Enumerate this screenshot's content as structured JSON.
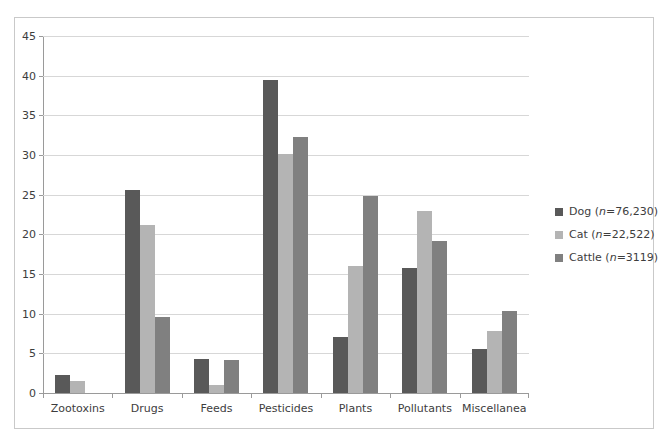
{
  "chart_data": {
    "type": "bar",
    "title": "",
    "subtitle": "",
    "xlabel": "",
    "ylabel": "",
    "ylim": [
      0,
      45
    ],
    "ytick_step": 5,
    "yticks": [
      45,
      40,
      35,
      30,
      25,
      20,
      15,
      10,
      5,
      0
    ],
    "grid": true,
    "legend_position": "right",
    "categories": [
      "Zootoxins",
      "Drugs",
      "Feeds",
      "Pesticides",
      "Plants",
      "Pollutants",
      "Miscellanea"
    ],
    "series": [
      {
        "name": "Dog (n=76,230)",
        "label_base": "Dog",
        "label_n": "n=76,230",
        "color": "#595959",
        "values": [
          2.3,
          25.6,
          4.3,
          39.4,
          7.0,
          15.8,
          5.5
        ]
      },
      {
        "name": "Cat (n=22,522)",
        "label_base": "Cat",
        "label_n": "n=22,522",
        "color": "#b4b4b4",
        "values": [
          1.5,
          21.2,
          1.0,
          30.1,
          16.0,
          23.0,
          7.8
        ]
      },
      {
        "name": "Cattle (n=3119)",
        "label_base": "Cattle",
        "label_n": "n=3119",
        "color": "#808080",
        "values": [
          0,
          9.6,
          4.2,
          32.3,
          24.8,
          19.1,
          10.3
        ]
      }
    ]
  },
  "colors": {
    "axis": "#9a9a9a",
    "gridline": "#d7d7d7",
    "border": "#c9c9c9",
    "text": "#3d3d3d",
    "background": "#ffffff"
  }
}
